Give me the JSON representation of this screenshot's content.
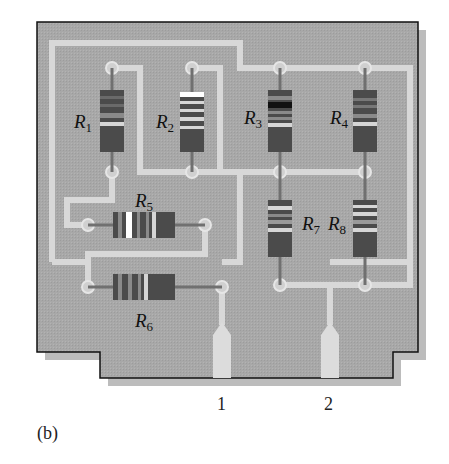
{
  "figure": {
    "caption": "(b)",
    "colors": {
      "board": "#a9a9a9",
      "board_shadow": "#bdbdbd",
      "board_outline": "#111111",
      "trace": "#d9d9d9",
      "resistor_body": "#4a4a4a",
      "resistor_band_light": "#d6d6d6",
      "resistor_band_white": "#ffffff",
      "resistor_band_black": "#111111",
      "lead": "#6e6e6e"
    },
    "resistors": [
      {
        "id": "R1",
        "letter": "R",
        "sub": "1",
        "orientation": "vertical"
      },
      {
        "id": "R2",
        "letter": "R",
        "sub": "2",
        "orientation": "vertical"
      },
      {
        "id": "R3",
        "letter": "R",
        "sub": "3",
        "orientation": "vertical"
      },
      {
        "id": "R4",
        "letter": "R",
        "sub": "4",
        "orientation": "vertical"
      },
      {
        "id": "R5",
        "letter": "R",
        "sub": "5",
        "orientation": "horizontal"
      },
      {
        "id": "R6",
        "letter": "R",
        "sub": "6",
        "orientation": "horizontal"
      },
      {
        "id": "R7",
        "letter": "R",
        "sub": "7",
        "orientation": "vertical"
      },
      {
        "id": "R8",
        "letter": "R",
        "sub": "8",
        "orientation": "vertical"
      }
    ],
    "terminals": [
      {
        "id": "terminal-1",
        "label": "1"
      },
      {
        "id": "terminal-2",
        "label": "2"
      }
    ]
  }
}
